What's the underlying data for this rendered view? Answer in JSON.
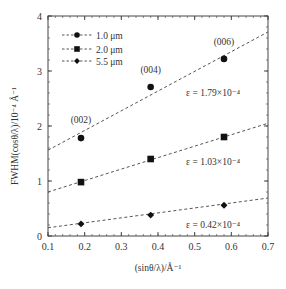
{
  "chart_data": {
    "type": "scatter",
    "title": "",
    "xlabel": "(sinθ/λ)/Å⁻¹",
    "ylabel": "FWHM(cosθ/λ)/10⁻⁴ Å⁻¹",
    "xlim": [
      0.1,
      0.7
    ],
    "ylim": [
      0,
      4
    ],
    "xticks": [
      0.1,
      0.2,
      0.3,
      0.4,
      0.5,
      0.6,
      0.7
    ],
    "xtick_labels": [
      "0.1",
      "0.2",
      "0.3",
      "0.4",
      "0.5",
      "0.6",
      "0.7"
    ],
    "yticks": [
      0,
      1,
      2,
      3,
      4
    ],
    "ytick_labels": [
      "0",
      "1",
      "2",
      "3",
      "4"
    ],
    "grid": false,
    "legend_position": "upper left",
    "series": [
      {
        "name": "1.0 μm",
        "marker": "circle",
        "x": [
          0.19,
          0.38,
          0.58
        ],
        "y": [
          1.78,
          2.71,
          3.22
        ],
        "fit_line": {
          "x": [
            0.1,
            0.7
          ],
          "y": [
            1.56,
            3.71
          ]
        },
        "strain_label": "ε = 1.79×10⁻⁴"
      },
      {
        "name": "2.0 μm",
        "marker": "square",
        "x": [
          0.19,
          0.38,
          0.58
        ],
        "y": [
          0.98,
          1.4,
          1.8
        ],
        "fit_line": {
          "x": [
            0.1,
            0.7
          ],
          "y": [
            0.8,
            2.05
          ]
        },
        "strain_label": "ε = 1.03×10⁻⁴"
      },
      {
        "name": "5.5 μm",
        "marker": "diamond",
        "x": [
          0.19,
          0.38,
          0.58
        ],
        "y": [
          0.22,
          0.38,
          0.56
        ],
        "fit_line": {
          "x": [
            0.1,
            0.7
          ],
          "y": [
            0.15,
            0.69
          ]
        },
        "strain_label": "ε = 0.42×10⁻⁴"
      }
    ],
    "annotations": [
      {
        "text": "(002)",
        "x": 0.19,
        "y": 2.05
      },
      {
        "text": "(004)",
        "x": 0.38,
        "y": 2.97
      },
      {
        "text": "(006)",
        "x": 0.58,
        "y": 3.47
      },
      {
        "text": "ε = 1.79×10⁻⁴",
        "x": 0.55,
        "y": 2.55
      },
      {
        "text": "ε = 1.03×10⁻⁴",
        "x": 0.55,
        "y": 1.3
      },
      {
        "text": "ε = 0.42×10⁻⁴",
        "x": 0.55,
        "y": 0.15
      }
    ]
  },
  "legend": {
    "items": [
      {
        "label": "1.0 μm",
        "marker": "circle"
      },
      {
        "label": "2.0 μm",
        "marker": "square"
      },
      {
        "label": "5.5 μm",
        "marker": "diamond"
      }
    ]
  },
  "axes": {
    "x_title": "(sinθ/λ)/Å⁻¹",
    "y_title": "FWHM(cosθ/λ)/10⁻⁴ Å⁻¹"
  }
}
